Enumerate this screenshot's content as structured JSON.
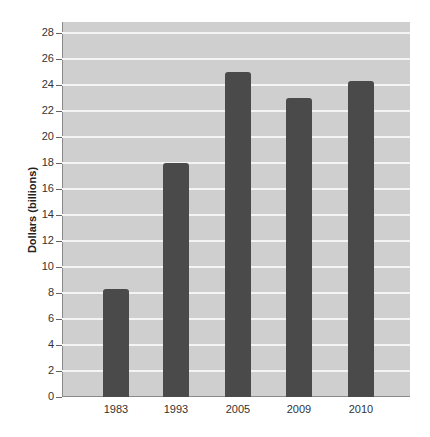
{
  "chart_data": {
    "type": "bar",
    "title": "",
    "xlabel": "",
    "ylabel": "Dollars (billions)",
    "categories": [
      "1983",
      "1993",
      "2005",
      "2009",
      "2010"
    ],
    "values": [
      8.3,
      18.0,
      25.0,
      23.0,
      24.3
    ],
    "ylim": [
      0,
      28
    ],
    "yticks": [
      0,
      2,
      4,
      6,
      8,
      10,
      12,
      14,
      16,
      18,
      20,
      22,
      24,
      26,
      28
    ],
    "grid": true,
    "legend": null,
    "colors": {
      "bar": "#4a4a4a",
      "plot_bg": "#cfcfcf",
      "grid": "#f4f4f4"
    }
  }
}
